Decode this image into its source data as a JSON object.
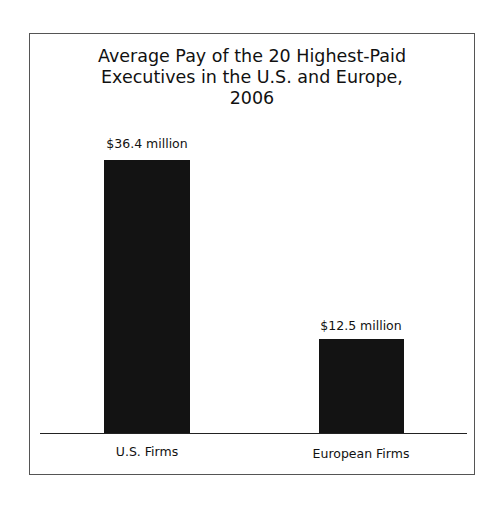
{
  "chart_data": {
    "type": "bar",
    "title": "Average Pay of the 20 Highest-Paid Executives in the U.S. and Europe, 2006",
    "title_lines": [
      "Average Pay of the 20 Highest-Paid",
      "Executives in the U.S. and Europe,",
      "2006"
    ],
    "categories": [
      "U.S. Firms",
      "European Firms"
    ],
    "values": [
      36.4,
      12.5
    ],
    "value_labels": [
      "$36.4 million",
      "$12.5 million"
    ],
    "unit": "million USD",
    "xlabel": "",
    "ylabel": "",
    "ylim": [
      0,
      40
    ],
    "grid": false,
    "legend": "none",
    "bar_color": "#131313"
  }
}
